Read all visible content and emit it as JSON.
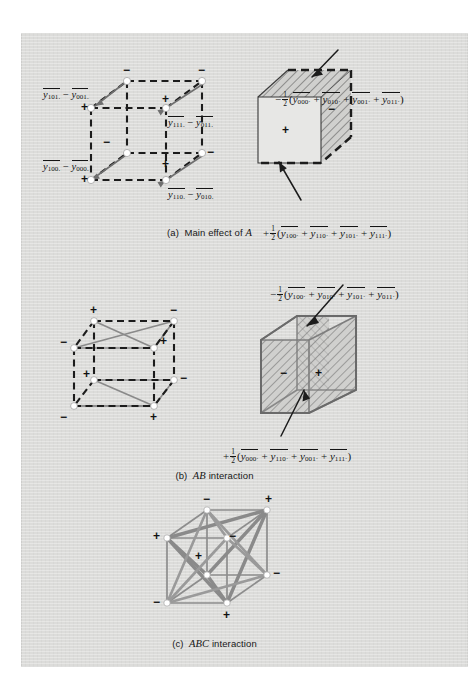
{
  "figure": {
    "background_color": "#dcdcda",
    "page_color": "#ffffff",
    "panels": [
      {
        "id": "a",
        "caption_prefix": "(a)",
        "caption_text_1": "Main effect of",
        "caption_italic": "A",
        "left_cube": {
          "contrast_labels": [
            {
              "name": "contrast-101-001",
              "text": "y̅101· − y̅001·",
              "base": "y",
              "sub_a": "101.",
              "sub_b": "001."
            },
            {
              "name": "contrast-111-011",
              "text": "y̅111· − y̅011·",
              "base": "y",
              "sub_a": "111.",
              "sub_b": "011."
            },
            {
              "name": "contrast-100-000",
              "text": "y̅100· − y̅000·",
              "base": "y",
              "sub_a": "100.",
              "sub_b": "000."
            },
            {
              "name": "contrast-110-010",
              "text": "y̅110· − y̅010·",
              "base": "y",
              "sub_a": "110.",
              "sub_b": "010."
            }
          ],
          "vertex_signs": [
            "−",
            "−",
            "+",
            "+",
            "−",
            "−",
            "+",
            "+"
          ]
        },
        "right_cube": {
          "top_formula_sign": "−",
          "top_formula_coeff": "1/2",
          "top_formula_terms": [
            "000·",
            "010·",
            "001·",
            "011·"
          ],
          "bottom_formula_sign": "+",
          "bottom_formula_coeff": "1/2",
          "bottom_formula_terms": [
            "100·",
            "110·",
            "101·",
            "111·"
          ],
          "face_sign_minus": "−",
          "face_sign_plus": "+"
        }
      },
      {
        "id": "b",
        "caption_prefix": "(b)",
        "caption_italic": "AB",
        "caption_text_1": "interaction",
        "left_cube": {
          "vertex_signs": [
            "+",
            "−",
            "−",
            "+",
            "+",
            "−",
            "−",
            "+"
          ]
        },
        "right_cube": {
          "top_formula_sign": "−",
          "top_formula_coeff": "1/2",
          "top_formula_terms": [
            "100·",
            "010·",
            "101·",
            "011·"
          ],
          "bottom_formula_sign": "+",
          "bottom_formula_coeff": "1/2",
          "bottom_formula_terms": [
            "000·",
            "110·",
            "001·",
            "111·"
          ],
          "face_sign_minus": "−",
          "face_sign_plus": "+"
        }
      },
      {
        "id": "c",
        "caption_prefix": "(c)",
        "caption_italic": "ABC",
        "caption_text_1": "interaction",
        "cube": {
          "vertex_signs": [
            "−",
            "+",
            "+",
            "−",
            "+",
            "−",
            "−",
            "+"
          ]
        }
      }
    ]
  }
}
